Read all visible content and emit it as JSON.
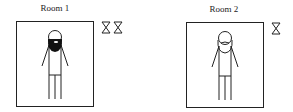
{
  "rooms": [
    {
      "label": "Room 1",
      "figure": "man-with-dark-beard",
      "hourglass_count": 2
    },
    {
      "label": "Room 2",
      "figure": "man-with-light-beard",
      "hourglass_count": 1
    }
  ],
  "icons": {
    "timer": "hourglass-icon"
  },
  "colors": {
    "stroke": "#222222",
    "background": "#ffffff"
  }
}
